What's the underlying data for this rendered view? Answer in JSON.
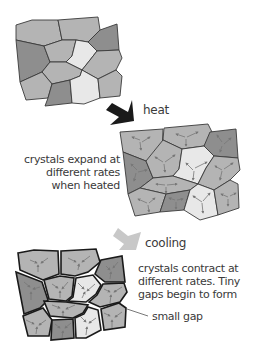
{
  "colors": {
    "crystal_light": "#e8e8e8",
    "crystal_mid": "#b4b4b4",
    "crystal_dark": "#8e8e8e",
    "outline": "#3a3a3a",
    "heat_arrow": "#1a1a1a",
    "cooling_arrow": "#c8c8c8",
    "vector_arrows": "#777777"
  },
  "stages": [
    {
      "id": "initial",
      "label": ""
    },
    {
      "id": "heated",
      "label": "crystals expand at different rates when heated"
    },
    {
      "id": "cooled",
      "label": "crystals contract at different rates. Tiny gaps begin to form"
    }
  ],
  "labels": {
    "heat": "heat",
    "expand_line1": "crystals expand at",
    "expand_line2": "different rates",
    "expand_line3": "when heated",
    "cooling": "cooling",
    "contract_line1": "crystals contract at",
    "contract_line2": "different rates. Tiny",
    "contract_line3": "gaps begin to form",
    "small_gap": "small gap"
  }
}
